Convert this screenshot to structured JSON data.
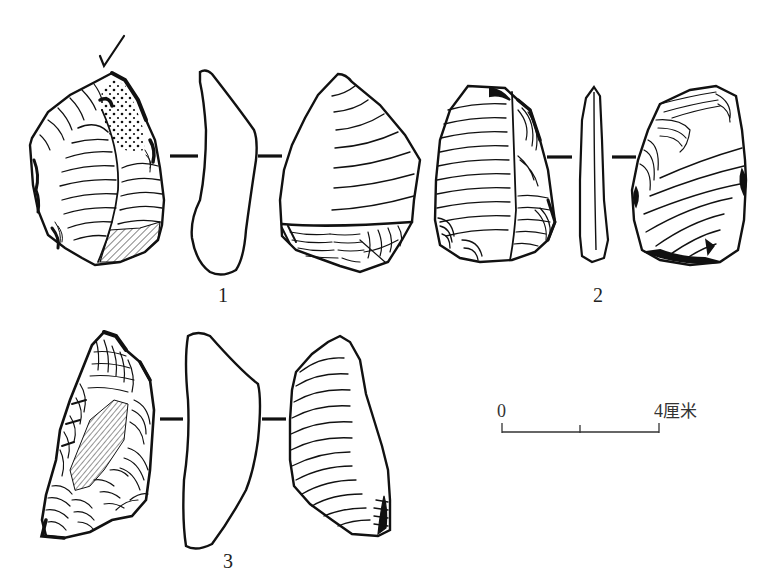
{
  "figure": {
    "artifacts": [
      {
        "id": "1",
        "label": "1",
        "views": [
          "dorsal-face",
          "side-profile",
          "ventral-face"
        ],
        "has_striking_arrow": true
      },
      {
        "id": "2",
        "label": "2",
        "views": [
          "dorsal-face",
          "side-profile",
          "ventral-face"
        ],
        "has_striking_arrow": false
      },
      {
        "id": "3",
        "label": "3",
        "views": [
          "dorsal-face",
          "side-profile",
          "ventral-face"
        ],
        "has_striking_arrow": false
      }
    ],
    "scale_bar": {
      "start_label": "0",
      "end_value": "4",
      "unit": "厘米",
      "divisions": 2
    },
    "colors": {
      "ink": "#111111",
      "background": "#ffffff"
    }
  }
}
